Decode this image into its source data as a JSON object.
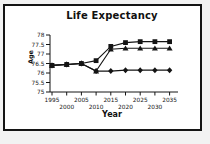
{
  "page": {
    "background_color": "#f2f2f2",
    "frame_border_color": "#141414",
    "plot_background_color": "#ffffff",
    "ink_color": "#141414"
  },
  "chart_data": {
    "type": "line",
    "title": "Life Expectancy",
    "xlabel": "Year",
    "ylabel": "Age",
    "x": [
      1995,
      2000,
      2005,
      2010,
      2015,
      2020,
      2025,
      2030,
      2035
    ],
    "xtick_labels": [
      "1995",
      "2000",
      "2005",
      "2010",
      "2015",
      "2020",
      "2025",
      "2030",
      "2035"
    ],
    "xtick_stagger": "alternate-rows",
    "xlim": [
      1995,
      2038
    ],
    "ylim": [
      75,
      78
    ],
    "yticks": [
      75,
      75.5,
      76,
      76.5,
      77,
      77.5,
      78
    ],
    "ytick_labels": [
      "75",
      "75.5",
      "76",
      "76.5",
      "77",
      "77.5",
      "78"
    ],
    "grid": false,
    "legend": "none",
    "series": [
      {
        "name": "square-series",
        "marker": "square",
        "color": "#141414",
        "values": [
          76.4,
          76.45,
          76.5,
          76.65,
          77.4,
          77.6,
          77.65,
          77.65,
          77.65
        ]
      },
      {
        "name": "triangle-series",
        "marker": "triangle",
        "color": "#141414",
        "values": [
          76.4,
          76.45,
          76.5,
          76.1,
          77.25,
          77.3,
          77.3,
          77.3,
          77.3
        ]
      },
      {
        "name": "diamond-series",
        "marker": "diamond",
        "color": "#141414",
        "values": [
          76.4,
          76.45,
          76.5,
          76.1,
          76.1,
          76.15,
          76.15,
          76.15,
          76.15
        ]
      }
    ]
  }
}
